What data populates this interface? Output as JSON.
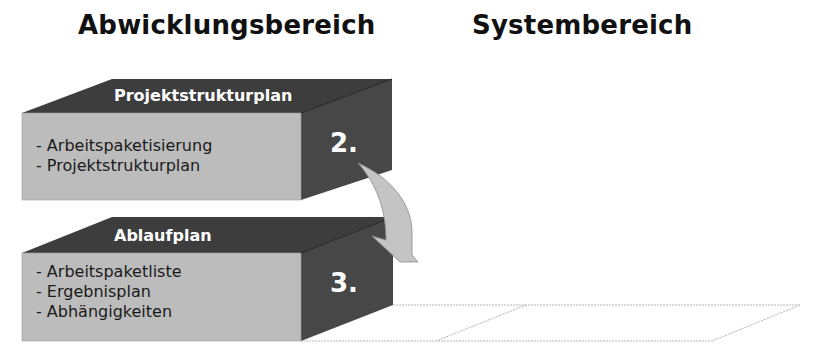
{
  "headings": {
    "left": "Abwicklungsbereich",
    "right": "Systembereich"
  },
  "blocks": [
    {
      "title": "Projektstrukturplan",
      "number": "2.",
      "items": [
        "Arbeitspaketisierung",
        "Projektstrukturplan"
      ]
    },
    {
      "title": "Ablaufplan",
      "number": "3.",
      "items": [
        "Arbeitspaketliste",
        "Ergebnisplan",
        "Abhängigkeiten"
      ]
    }
  ],
  "colors": {
    "top_face": "#3d3d3d",
    "side_face": "#474747",
    "front_face": "#bcbcbc",
    "arrow": "#c4c4c4",
    "dotted_outline": "#b5b5b5"
  },
  "connector": {
    "type": "curved-arrow",
    "from": "2.",
    "to": "3."
  }
}
